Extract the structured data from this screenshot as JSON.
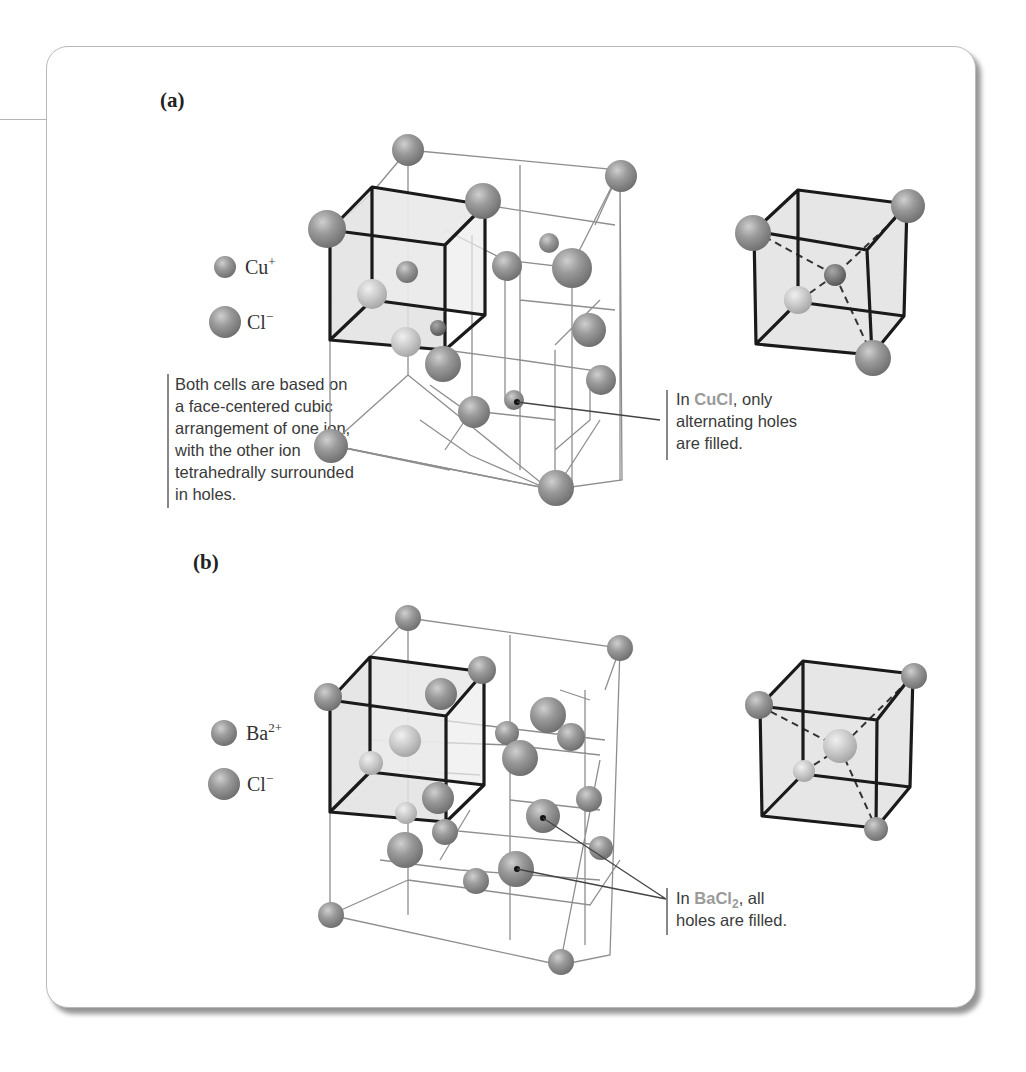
{
  "figure": {
    "panel_a": {
      "label": "(a)",
      "legend": [
        {
          "ion": "Cu",
          "charge": "+",
          "size": "small"
        },
        {
          "ion": "Cl",
          "charge": "−",
          "size": "large"
        }
      ],
      "side_note": [
        "Both cells are based on",
        "a face-centered cubic",
        "arrangement of one ion,",
        "with the other ion",
        "tetrahedrally surrounded",
        "in holes."
      ],
      "callout": {
        "prefix": "In ",
        "compound": "CuCl",
        "line1_suffix": ", only",
        "line2": "alternating holes",
        "line3": "are filled."
      }
    },
    "panel_b": {
      "label": "(b)",
      "legend": [
        {
          "ion": "Ba",
          "charge": "2+",
          "size": "small"
        },
        {
          "ion": "Cl",
          "charge": "−",
          "size": "large"
        }
      ],
      "callout": {
        "prefix": "In ",
        "compound": "BaCl",
        "compound_subscript": "2",
        "line1_suffix": ", all",
        "line2": "holes are filled."
      }
    }
  },
  "colors": {
    "sphere": "#8f8f8f",
    "highlight_text": "#9a9a9a",
    "cube_fill": "#e4e4e4"
  }
}
